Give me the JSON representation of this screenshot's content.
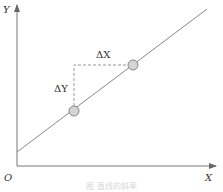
{
  "diagram": {
    "type": "slope-of-line",
    "axes": {
      "x_label": "X",
      "y_label": "Y",
      "origin_label": "O"
    },
    "annotations": {
      "delta_x": "ΔX",
      "delta_y": "ΔY"
    },
    "line": {
      "from": [
        17,
        152
      ],
      "to": [
        207,
        9
      ]
    },
    "points": [
      {
        "name": "point-1",
        "x": 74,
        "y": 111
      },
      {
        "name": "point-2",
        "x": 133,
        "y": 65
      }
    ],
    "caption": "图 直线的斜率"
  },
  "colors": {
    "axis": "#555555",
    "line": "#888888",
    "dash": "#999999",
    "point_fill": "#d4d4d4",
    "point_stroke": "#888888"
  }
}
